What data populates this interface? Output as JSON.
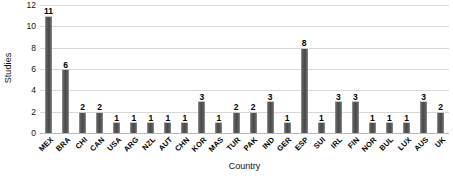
{
  "chart_data": {
    "type": "bar",
    "title": "",
    "xlabel": "Country",
    "ylabel": "Studies",
    "ylim": [
      0,
      12
    ],
    "yticks": [
      0,
      2,
      4,
      6,
      8,
      10,
      12
    ],
    "grid": true,
    "legend": false,
    "legend_position": "none",
    "orientation": "vertical",
    "categories": [
      "MEX",
      "BRA",
      "CHI",
      "CAN",
      "USA",
      "ARG",
      "NZL",
      "AUT",
      "CHN",
      "KOR",
      "MAS",
      "TUR",
      "PAK",
      "IND",
      "GER",
      "ESP",
      "SUI",
      "IRL",
      "FIN",
      "NOR",
      "BUL",
      "LUX",
      "AUS",
      "UK"
    ],
    "values": [
      11,
      6,
      2,
      2,
      1,
      1,
      1,
      1,
      1,
      3,
      1,
      2,
      2,
      3,
      1,
      8,
      1,
      3,
      3,
      1,
      1,
      1,
      3,
      2
    ],
    "data_labels": [
      "11",
      "6",
      "2",
      "2",
      "1",
      "1",
      "1",
      "1",
      "1",
      "3",
      "1",
      "2",
      "2",
      "3",
      "1",
      "8",
      "1",
      "3",
      "3",
      "1",
      "1",
      "1",
      "3",
      "2"
    ],
    "bar_color": "#4a4a4a",
    "grid_color": "#d8d8d8",
    "background_color": "#ffffff"
  }
}
